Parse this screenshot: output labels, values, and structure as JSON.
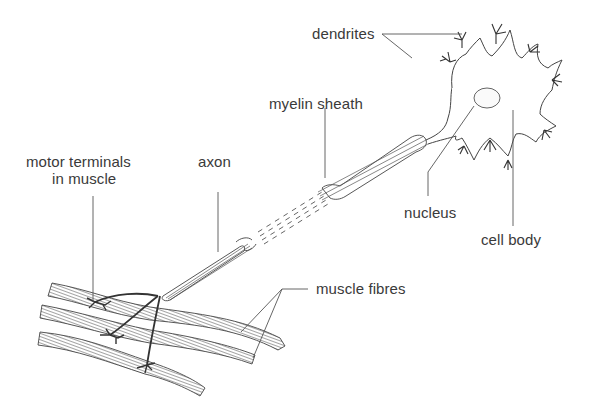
{
  "diagram": {
    "labels": {
      "dendrites": "dendrites",
      "myelin_sheath": "myelin sheath",
      "axon": "axon",
      "motor_terminals_line1": "motor terminals",
      "motor_terminals_line2": "in muscle",
      "nucleus": "nucleus",
      "cell_body": "cell body",
      "muscle_fibres": "muscle fibres"
    },
    "colors": {
      "ink": "#3a3a3a",
      "background": "#ffffff"
    }
  }
}
